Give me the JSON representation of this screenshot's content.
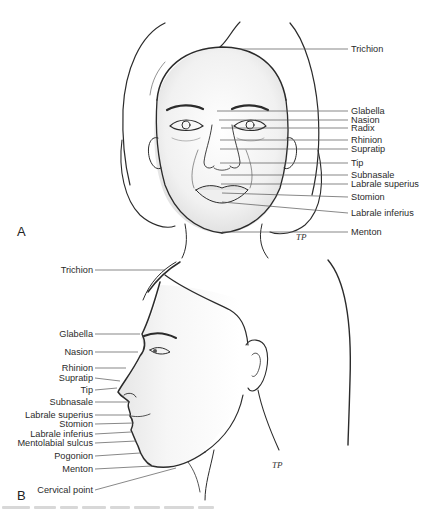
{
  "figure": {
    "panel_a": {
      "letter": "A",
      "view": "frontal",
      "landmarks": [
        {
          "label": "Trichion",
          "y": 49
        },
        {
          "label": "Glabella",
          "y": 111
        },
        {
          "label": "Nasion",
          "y": 120
        },
        {
          "label": "Radix",
          "y": 128
        },
        {
          "label": "Rhinion",
          "y": 140
        },
        {
          "label": "Supratip",
          "y": 149
        },
        {
          "label": "Tip",
          "y": 163
        },
        {
          "label": "Subnasale",
          "y": 175
        },
        {
          "label": "Labrale superius",
          "y": 184
        },
        {
          "label": "Stomion",
          "y": 197
        },
        {
          "label": "Labrale inferius",
          "y": 213
        },
        {
          "label": "Menton",
          "y": 232
        }
      ]
    },
    "panel_b": {
      "letter": "B",
      "view": "lateral",
      "landmarks": [
        {
          "label": "Trichion",
          "y": 270
        },
        {
          "label": "Glabella",
          "y": 334
        },
        {
          "label": "Nasion",
          "y": 352
        },
        {
          "label": "Rhinion",
          "y": 368
        },
        {
          "label": "Supratip",
          "y": 378
        },
        {
          "label": "Tip",
          "y": 390
        },
        {
          "label": "Subnasale",
          "y": 402
        },
        {
          "label": "Labrale superius",
          "y": 415
        },
        {
          "label": "Stomion",
          "y": 424
        },
        {
          "label": "Labrale inferius",
          "y": 434
        },
        {
          "label": "Mentolabial sulcus",
          "y": 443
        },
        {
          "label": "Pogonion",
          "y": 456
        },
        {
          "label": "Menton",
          "y": 469
        },
        {
          "label": "Cervical point",
          "y": 490
        }
      ]
    },
    "artist_signature": "TP"
  }
}
